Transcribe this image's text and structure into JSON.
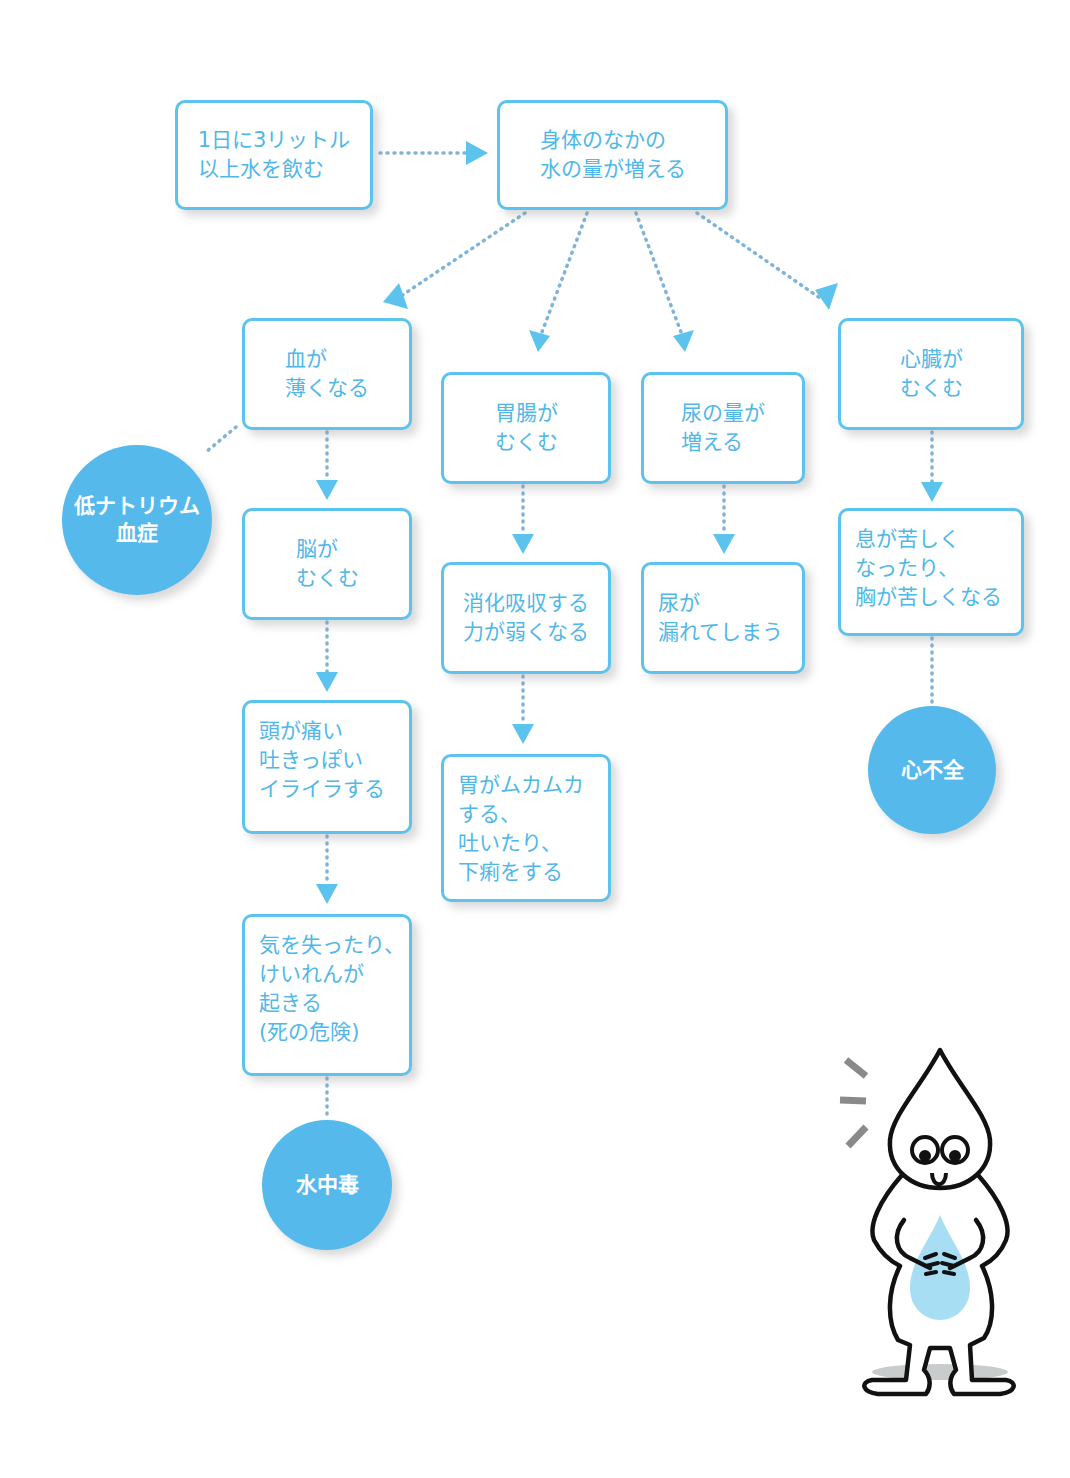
{
  "diagram": {
    "colors": {
      "accent": "#5cc3ee",
      "text": "#4fb8e8",
      "circle": "#55b9ec",
      "dots": "#7f9cc0"
    },
    "start": {
      "label": "1日に3リットル\n以上水を飲む"
    },
    "main": {
      "label": "身体のなかの\n水の量が増える"
    },
    "branches": {
      "blood": {
        "steps": [
          "血が\n薄くなる",
          "脳が\nむくむ",
          "頭が痛い\n吐きっぽい\nイライラする",
          "気を失ったり、\nけいれんが\n起きる\n(死の危険)"
        ],
        "side_outcome": "低ナトリウム\n血症",
        "outcome": "水中毒"
      },
      "stomach": {
        "steps": [
          "胃腸が\nむくむ",
          "消化吸収する\n力が弱くなる",
          "胃がムカムカ\nする、\n吐いたり、\n下痢をする"
        ]
      },
      "urine": {
        "steps": [
          "尿の量が\n増える",
          "尿が\n漏れてしまう"
        ]
      },
      "heart": {
        "steps": [
          "心臓が\nむくむ",
          "息が苦しく\nなったり、\n胸が苦しくなる"
        ],
        "outcome": "心不全"
      }
    },
    "illustration": {
      "name": "water-drop-character-holding-belly"
    }
  }
}
